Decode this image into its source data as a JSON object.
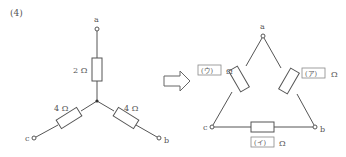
{
  "problem_number": "(4)",
  "star": {
    "terminals": {
      "a": "a",
      "b": "b",
      "c": "c"
    },
    "resistors": {
      "a_branch": "2 Ω",
      "c_branch": "4 Ω",
      "b_branch": "4 Ω"
    }
  },
  "arrow": {
    "label": "transform-arrow"
  },
  "delta": {
    "terminals": {
      "a": "a",
      "b": "b",
      "c": "c"
    },
    "blanks": {
      "ab": "(ア)",
      "bc": "(イ)",
      "ca": "(ウ)"
    },
    "unit": "Ω"
  },
  "colors": {
    "line": "#555555",
    "blank_border": "#888888"
  }
}
